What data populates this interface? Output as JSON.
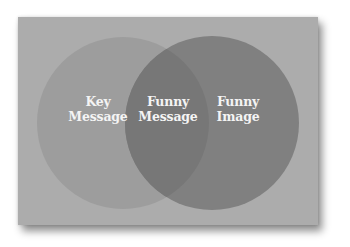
{
  "diagram": {
    "type": "venn",
    "colors": {
      "card_background": "#acacac",
      "left_circle": "#9d9d9d",
      "right_circle": "#808080",
      "overlap": "#787878",
      "label_text": "#f4f4f4"
    },
    "sets": [
      {
        "id": "key-message",
        "label_lines": [
          "Key",
          "Message"
        ]
      },
      {
        "id": "funny-image",
        "label_lines": [
          "Funny",
          "Image"
        ]
      }
    ],
    "intersection": {
      "id": "funny-message",
      "label_lines": [
        "Funny",
        "Message"
      ]
    }
  }
}
